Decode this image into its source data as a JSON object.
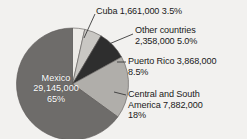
{
  "chart_data": {
    "type": "pie",
    "title": "",
    "categories": [
      "Cuba",
      "Other countries",
      "Puerto Rico",
      "Central and South America",
      "Mexico"
    ],
    "values": [
      1661000,
      2358000,
      3868000,
      7882000,
      29145000
    ],
    "percents": [
      3.5,
      5.0,
      8.5,
      18,
      65
    ],
    "value_labels": [
      "1,661,000",
      "2,358,000",
      "3,868,000",
      "7,882,000",
      "29,145,000"
    ],
    "percent_labels": [
      "3.5%",
      "5.0%",
      "8.5%",
      "18%",
      "65%"
    ],
    "colors": [
      "#eceae6",
      "#c9c7c3",
      "#2e2e2e",
      "#b0aeaa",
      "#6e6c6a"
    ],
    "legend_position": "callout-right",
    "grid": false
  },
  "labels": {
    "cuba": {
      "name": "Cuba",
      "value": "1,661,000",
      "percent": "3.5%",
      "line1": "Cuba  1,661,000  3.5%"
    },
    "other": {
      "name": "Other countries",
      "value": "2,358,000",
      "percent": "5.0%",
      "line1": "Other countries",
      "line2": "2,358,000  5.0%"
    },
    "puerto_rico": {
      "name": "Puerto Rico",
      "value": "3,868,000",
      "percent": "8.5%",
      "line1": "Puerto Rico  3,868,000",
      "line2": "8.5%"
    },
    "central_south_america": {
      "name": "Central and South America",
      "value": "7,882,000",
      "percent": "18%",
      "line1": "Central and South",
      "line2": "America  7,882,000",
      "line3": "18%"
    },
    "mexico": {
      "name": "Mexico",
      "value": "29,145,000",
      "percent": "65%",
      "line1": "Mexico",
      "line2": "29,145,000",
      "line3": "65%"
    }
  }
}
